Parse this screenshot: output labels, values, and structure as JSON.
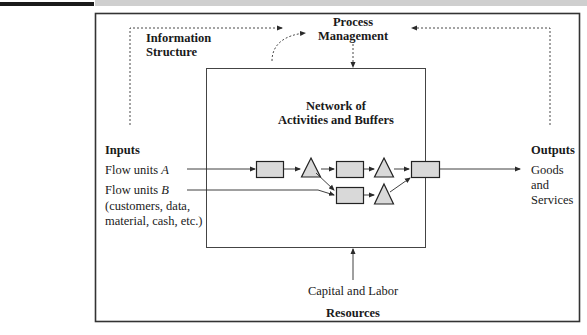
{
  "diagram": {
    "title_labels": {
      "information_structure": [
        "Information",
        "Structure"
      ],
      "process_management": [
        "Process",
        "Management"
      ],
      "network": [
        "Network of",
        "Activities and Buffers"
      ],
      "inputs_heading": "Inputs",
      "outputs_heading": "Outputs",
      "resources_heading": "Resources",
      "capital_labor": "Capital and Labor"
    },
    "inputs": {
      "flow_a_prefix": "Flow units ",
      "flow_a_var": "A",
      "flow_b_prefix": "Flow units ",
      "flow_b_var": "B",
      "flow_b_detail_1": "(customers, data,",
      "flow_b_detail_2": "material, cash, etc.)"
    },
    "outputs": {
      "lines": [
        "Goods",
        "and",
        "Services"
      ]
    },
    "nodes": {
      "activities": [
        "activity-1",
        "activity-2",
        "activity-3",
        "activity-4"
      ],
      "buffers": [
        "buffer-1",
        "buffer-2",
        "buffer-3"
      ]
    },
    "colors": {
      "node_fill": "#d9d9d9",
      "line": "#2a2a2a",
      "frame": "#333333",
      "top_gray": "#cfcfcf"
    }
  }
}
